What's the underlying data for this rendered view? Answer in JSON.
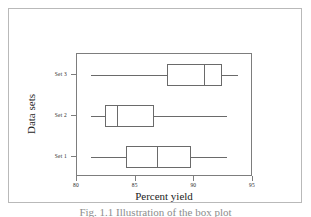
{
  "figure": {
    "caption": "Fig. 1.1   Illustration of the box plot"
  },
  "chart_data": {
    "type": "box",
    "title": "",
    "xlabel": "Percent yield",
    "ylabel": "Data sets",
    "orientation": "horizontal",
    "xlim": [
      80,
      95
    ],
    "xticks": [
      80,
      85,
      90,
      95
    ],
    "xtick_labels": [
      "80",
      "85",
      "90",
      "95"
    ],
    "ytick_labels": [
      "Set 1",
      "Set 2",
      "Set 3"
    ],
    "grid": false,
    "legend": null,
    "boxes": [
      {
        "label": "Set 3",
        "whisker_low": 81.2,
        "q1": 87.7,
        "median": 90.8,
        "q3": 92.4,
        "whisker_high": 93.7
      },
      {
        "label": "Set 2",
        "whisker_low": 81.2,
        "q1": 82.4,
        "median": 83.4,
        "q3": 86.6,
        "whisker_high": 92.8
      },
      {
        "label": "Set 1",
        "whisker_low": 81.2,
        "q1": 84.2,
        "median": 86.8,
        "q3": 89.7,
        "whisker_high": 92.8
      }
    ]
  },
  "style": {
    "line_color": "#6a6a6a",
    "axis_color": "#7d7d7d",
    "frame_color": "#b9b9b9",
    "text_color": "#1d1d1d",
    "background": "#ffffff"
  }
}
